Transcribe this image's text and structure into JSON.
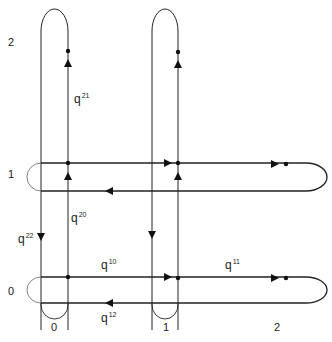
{
  "axes": {
    "y_labels": [
      {
        "text": "2",
        "x": 8,
        "y": 37
      },
      {
        "text": "1",
        "x": 8,
        "y": 169
      },
      {
        "text": "0",
        "x": 8,
        "y": 286
      }
    ],
    "x_labels": [
      {
        "text": "0",
        "x": 51,
        "y": 322
      },
      {
        "text": "1",
        "x": 163,
        "y": 322
      },
      {
        "text": "2",
        "x": 274,
        "y": 322
      }
    ]
  },
  "edges": [
    {
      "name": "q21",
      "base": "q",
      "sup": "21",
      "x": 74,
      "y": 92
    },
    {
      "name": "q20",
      "base": "q",
      "sup": "20",
      "x": 71,
      "y": 211
    },
    {
      "name": "q22",
      "base": "q",
      "sup": "22",
      "x": 18,
      "y": 232
    },
    {
      "name": "q10",
      "base": "q",
      "sup": "10",
      "x": 101,
      "y": 258
    },
    {
      "name": "q11",
      "base": "q",
      "sup": "11",
      "x": 225,
      "y": 258
    },
    {
      "name": "q12",
      "base": "q",
      "sup": "12",
      "x": 101,
      "y": 311
    }
  ],
  "colors": {
    "stroke": "#222222",
    "background": "#ffffff"
  }
}
